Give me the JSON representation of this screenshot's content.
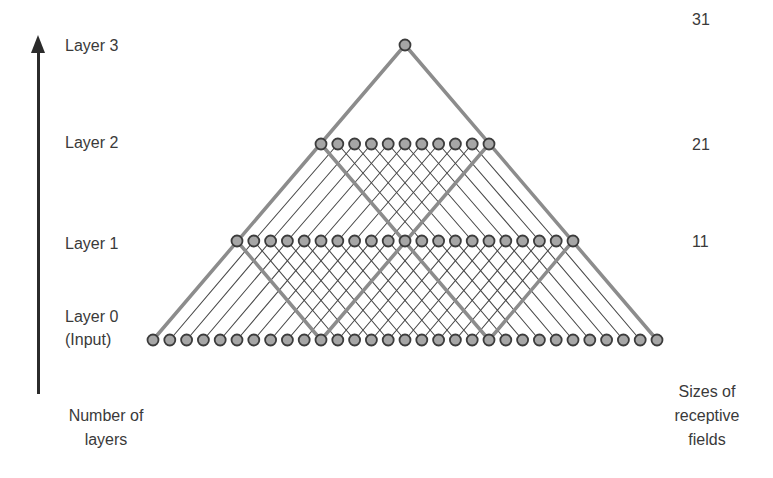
{
  "axis": {
    "left_caption_line1": "Number of",
    "left_caption_line2": "layers",
    "right_caption_line1": "Sizes of",
    "right_caption_line2": "receptive",
    "right_caption_line3": "fields"
  },
  "layers": [
    {
      "label": "Layer 0",
      "sublabel": "(Input)",
      "node_count": 31,
      "receptive_field": "",
      "y": 340
    },
    {
      "label": "Layer 1",
      "sublabel": "",
      "node_count": 21,
      "receptive_field": "11",
      "y": 241
    },
    {
      "label": "Layer 2",
      "sublabel": "",
      "node_count": 11,
      "receptive_field": "21",
      "y": 144
    },
    {
      "label": "Layer 3",
      "sublabel": "",
      "node_count": 1,
      "receptive_field": "31",
      "y": 45
    }
  ],
  "kernel_size": 11,
  "geometry": {
    "x0": 153,
    "node_spacing": 16.8,
    "node_radius": 5.5
  },
  "colors": {
    "node_fill": "#a6a6a6",
    "node_stroke": "#3c3c3c",
    "edge": "#4a4a4a",
    "highlight_edge": "#8c8c8c",
    "axis": "#2b2b2b",
    "text": "#3a3a3a"
  }
}
